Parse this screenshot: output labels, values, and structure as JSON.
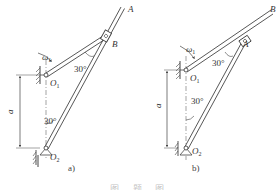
{
  "figure_a": {
    "caption": "a)",
    "labels": {
      "point_A": "A",
      "point_B": "B",
      "pivot_O1": "O",
      "pivot_O1_sub": "1",
      "pivot_O2": "O",
      "pivot_O2_sub": "2",
      "omega": "ω",
      "omega_sub": "1",
      "angle_top": "30°",
      "angle_bottom": "30°",
      "distance": "a"
    }
  },
  "figure_b": {
    "caption": "b)",
    "labels": {
      "point_A": "A",
      "point_B": "B",
      "pivot_O1": "O",
      "pivot_O1_sub": "1",
      "pivot_O2": "O",
      "pivot_O2_sub": "2",
      "omega": "ω",
      "omega_sub": "1",
      "angle_top": "30°",
      "angle_bottom": "30°",
      "distance": "a"
    }
  },
  "caption": {
    "text": "图 — 题 — 图"
  },
  "colors": {
    "line": "#444444",
    "text": "#333333",
    "background": "#ffffff"
  }
}
